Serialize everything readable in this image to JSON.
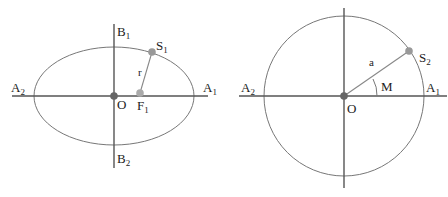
{
  "figures": [
    {
      "id": "ellipse",
      "shape": "ellipse",
      "labels": {
        "A1": {
          "base": "A",
          "sub": "1"
        },
        "A2": {
          "base": "A",
          "sub": "2"
        },
        "B1": {
          "base": "B",
          "sub": "1"
        },
        "B2": {
          "base": "B",
          "sub": "2"
        },
        "S1": {
          "base": "S",
          "sub": "1"
        },
        "F1": {
          "base": "F",
          "sub": "1"
        },
        "O": "O",
        "r": "r"
      },
      "colors": {
        "center_point": "#666666",
        "focus_point": "#aaaaaa",
        "body_point": "#999999"
      }
    },
    {
      "id": "circle",
      "shape": "circle",
      "labels": {
        "A1": {
          "base": "A",
          "sub": "1"
        },
        "A2": {
          "base": "A",
          "sub": "2"
        },
        "S2": {
          "base": "S",
          "sub": "2"
        },
        "O": "O",
        "a": "a",
        "M": "M"
      },
      "colors": {
        "center_point": "#666666",
        "body_point": "#999999"
      }
    }
  ]
}
